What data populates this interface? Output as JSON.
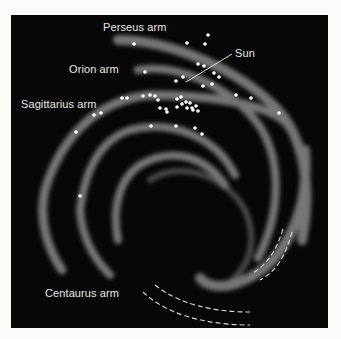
{
  "figure": {
    "background": "#070707",
    "page_background": "#fbfbfa",
    "arm_color": "#8a8a8a",
    "dot_color": "#ffffff",
    "labels": {
      "perseus": "Perseus arm",
      "orion": "Orion arm",
      "sagittarius": "Sagittarius arm",
      "centaurus": "Centaurus arm",
      "sun": "Sun"
    },
    "sun_position": [
      186,
      82
    ],
    "dots": [
      [
        134,
        44
      ],
      [
        187,
        43
      ],
      [
        208,
        35
      ],
      [
        205,
        44
      ],
      [
        145,
        72
      ],
      [
        198,
        64
      ],
      [
        204,
        66
      ],
      [
        214,
        73
      ],
      [
        219,
        77
      ],
      [
        176,
        81
      ],
      [
        183,
        77
      ],
      [
        203,
        86
      ],
      [
        212,
        84
      ],
      [
        236,
        95
      ],
      [
        251,
        98
      ],
      [
        279,
        113
      ],
      [
        122,
        98
      ],
      [
        127,
        98
      ],
      [
        143,
        96
      ],
      [
        150,
        95
      ],
      [
        155,
        96
      ],
      [
        158,
        100
      ],
      [
        177,
        99
      ],
      [
        181,
        97
      ],
      [
        182,
        104
      ],
      [
        186,
        102
      ],
      [
        187,
        108
      ],
      [
        190,
        103
      ],
      [
        192,
        108
      ],
      [
        193,
        110
      ],
      [
        196,
        106
      ],
      [
        198,
        111
      ],
      [
        160,
        108
      ],
      [
        166,
        109
      ],
      [
        167,
        112
      ],
      [
        177,
        107
      ],
      [
        94,
        115
      ],
      [
        101,
        113
      ],
      [
        76,
        132
      ],
      [
        151,
        126
      ],
      [
        176,
        126
      ],
      [
        195,
        128
      ],
      [
        202,
        134
      ],
      [
        80,
        196
      ]
    ]
  }
}
